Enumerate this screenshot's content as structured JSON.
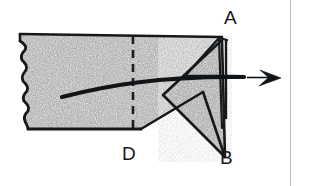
{
  "figure": {
    "type": "line-drawing-diagram",
    "background_color": "#ffffff",
    "stroke_color": "#16191c",
    "fill_texture_color": "#9a9a9a",
    "labels": [
      {
        "id": "A",
        "text": "A",
        "position": "top-right",
        "x": 224,
        "y": 8
      },
      {
        "id": "B",
        "text": "B",
        "position": "bottom-right",
        "x": 220,
        "y": 148
      },
      {
        "id": "D",
        "text": "D",
        "position": "bottom-center",
        "x": 122,
        "y": 144
      }
    ],
    "elements": {
      "sheet_name": "textured sheet with torn left edge",
      "fold_line_name": "vertical dashed fold line",
      "fold_line_style": "dashed",
      "corner_fold_name": "folded triangular corner",
      "arrow_name": "curved direction arrow",
      "arrow_direction": "right",
      "margin_rule_name": "page margin rule",
      "margin_rule_color": "#b9b9b9",
      "margin_rule_x": 290
    }
  }
}
